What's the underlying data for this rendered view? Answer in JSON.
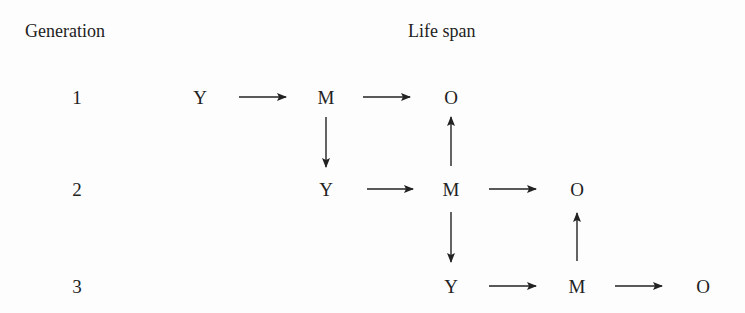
{
  "headers": {
    "generation": "Generation",
    "life_span": "Life span"
  },
  "generations": [
    {
      "label": "1",
      "y": 97
    },
    {
      "label": "2",
      "y": 189
    },
    {
      "label": "3",
      "y": 286
    }
  ],
  "nodes": [
    {
      "id": "g1-y",
      "text": "Y",
      "x": 200,
      "y": 97
    },
    {
      "id": "g1-m",
      "text": "M",
      "x": 326,
      "y": 97
    },
    {
      "id": "g1-o",
      "text": "O",
      "x": 451,
      "y": 97
    },
    {
      "id": "g2-y",
      "text": "Y",
      "x": 326,
      "y": 189
    },
    {
      "id": "g2-m",
      "text": "M",
      "x": 451,
      "y": 189
    },
    {
      "id": "g2-o",
      "text": "O",
      "x": 577,
      "y": 189
    },
    {
      "id": "g3-y",
      "text": "Y",
      "x": 451,
      "y": 286
    },
    {
      "id": "g3-m",
      "text": "M",
      "x": 577,
      "y": 286
    },
    {
      "id": "g3-o",
      "text": "O",
      "x": 703,
      "y": 286
    }
  ],
  "edges": [
    {
      "from": "g1-y",
      "to": "g1-m",
      "dir": "right"
    },
    {
      "from": "g1-m",
      "to": "g1-o",
      "dir": "right"
    },
    {
      "from": "g1-m",
      "to": "g2-y",
      "dir": "down"
    },
    {
      "from": "g2-m",
      "to": "g1-o",
      "dir": "up"
    },
    {
      "from": "g2-y",
      "to": "g2-m",
      "dir": "right"
    },
    {
      "from": "g2-m",
      "to": "g2-o",
      "dir": "right"
    },
    {
      "from": "g2-m",
      "to": "g3-y",
      "dir": "down"
    },
    {
      "from": "g3-m",
      "to": "g2-o",
      "dir": "up"
    },
    {
      "from": "g3-y",
      "to": "g3-m",
      "dir": "right"
    },
    {
      "from": "g3-m",
      "to": "g3-o",
      "dir": "right"
    }
  ],
  "colors": {
    "ink": "#222222",
    "background": "#fdfdfd"
  }
}
